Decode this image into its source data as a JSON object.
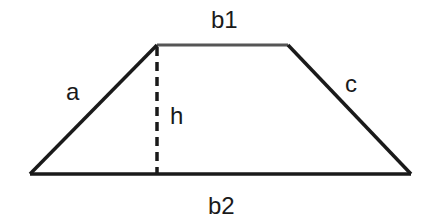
{
  "diagram": {
    "type": "trapezoid",
    "stroke_color": "#1a1a1a",
    "vertices": {
      "top_left": [
        157,
        45
      ],
      "top_right": [
        288,
        45
      ],
      "bottom_right": [
        411,
        174
      ],
      "bottom_left": [
        30,
        174
      ]
    },
    "labels": {
      "top_base": "b1",
      "bottom_base": "b2",
      "left_side": "a",
      "right_side": "c",
      "height": "h"
    }
  }
}
